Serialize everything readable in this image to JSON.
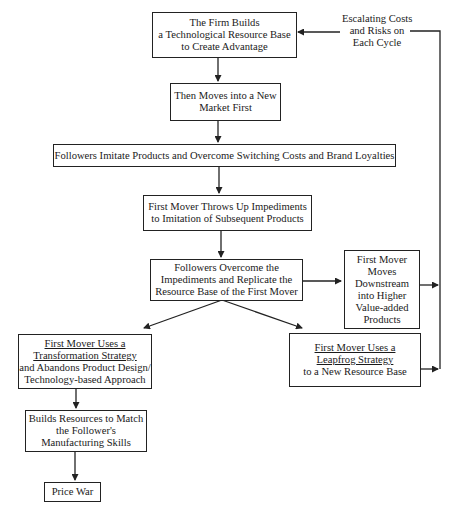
{
  "diagram": {
    "type": "flowchart",
    "nodes": {
      "firm_builds": {
        "lines": [
          "The Firm Builds",
          "a Technological Resource Base",
          "to Create Advantage"
        ]
      },
      "moves_first": {
        "lines": [
          "Then Moves into a New",
          "Market First"
        ]
      },
      "followers_imitate": {
        "lines": [
          "Followers Imitate Products and Overcome Switching Costs and Brand Loyalties"
        ]
      },
      "impediments": {
        "lines": [
          "First Mover Throws Up Impediments",
          "to Imitation of Subsequent Products"
        ]
      },
      "followers_overcome": {
        "lines": [
          "Followers Overcome the",
          "Impediments and Replicate the",
          "Resource Base of the First Mover"
        ]
      },
      "downstream": {
        "lines": [
          "First Mover",
          "Moves",
          "Downstream",
          "into Higher",
          "Value-added",
          "Products"
        ]
      },
      "transformation": {
        "underlined": [
          "First Mover Uses a",
          "Transformation Strategy"
        ],
        "lines": [
          "and Abandons Product Design/",
          "Technology-based Approach"
        ]
      },
      "leapfrog": {
        "underlined": [
          "First Mover Uses a",
          "Leapfrog Strategy"
        ],
        "lines": [
          "to a New Resource Base"
        ]
      },
      "builds_resources": {
        "lines": [
          "Builds Resources to Match",
          "the Follower's",
          "Manufacturing Skills"
        ]
      },
      "price_war": {
        "lines": [
          "Price War"
        ]
      }
    },
    "feedback_label": {
      "lines": [
        "Escalating Costs",
        "and Risks on",
        "Each Cycle"
      ]
    },
    "edges": [
      [
        "firm_builds",
        "moves_first"
      ],
      [
        "moves_first",
        "followers_imitate"
      ],
      [
        "followers_imitate",
        "impediments"
      ],
      [
        "impediments",
        "followers_overcome"
      ],
      [
        "followers_overcome",
        "downstream"
      ],
      [
        "followers_overcome",
        "transformation"
      ],
      [
        "followers_overcome",
        "leapfrog"
      ],
      [
        "transformation",
        "builds_resources"
      ],
      [
        "builds_resources",
        "price_war"
      ],
      [
        "downstream",
        "feedback_loop"
      ],
      [
        "leapfrog",
        "feedback_loop"
      ],
      [
        "feedback_loop",
        "firm_builds"
      ]
    ]
  }
}
